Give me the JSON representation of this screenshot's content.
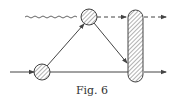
{
  "figure": {
    "caption": "Fig. 6",
    "colors": {
      "ink": "#4a4a4a",
      "background": "#ffffff"
    },
    "elements": {
      "incoming_wavy_line": "photon-like wavy line entering upper vertex",
      "upper_vertex": "hatched circle",
      "lower_vertex": "hatched circle",
      "blob": "hatched vertical rounded bar",
      "incoming_solid_line": "solid line with arrow entering lower vertex",
      "outgoing_dashed_line": "dashed line with arrow leaving blob",
      "outgoing_solid_line": "solid line with arrow leaving blob"
    }
  }
}
